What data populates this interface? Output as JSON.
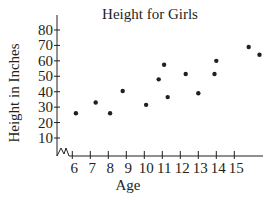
{
  "chart_data": {
    "type": "scatter",
    "title": "Height for Girls",
    "xlabel": "Age",
    "ylabel": "Height in Inches",
    "x_ticks": [
      6,
      7,
      8,
      9,
      10,
      11,
      12,
      13,
      14,
      15
    ],
    "y_ticks": [
      10,
      20,
      30,
      40,
      50,
      60,
      70,
      80
    ],
    "xlim": [
      5,
      16.5
    ],
    "ylim": [
      0,
      85
    ],
    "axis_break": true,
    "grid": false,
    "legend": null,
    "series": [
      {
        "name": "Girls",
        "points": [
          {
            "x": 6.2,
            "y": 26
          },
          {
            "x": 7.3,
            "y": 33
          },
          {
            "x": 8.1,
            "y": 26
          },
          {
            "x": 8.8,
            "y": 40.5
          },
          {
            "x": 10.1,
            "y": 31.5
          },
          {
            "x": 10.8,
            "y": 48
          },
          {
            "x": 11.1,
            "y": 57.5
          },
          {
            "x": 11.3,
            "y": 36.5
          },
          {
            "x": 12.3,
            "y": 51.5
          },
          {
            "x": 13.0,
            "y": 39
          },
          {
            "x": 13.9,
            "y": 51.5
          },
          {
            "x": 14.0,
            "y": 60
          },
          {
            "x": 15.8,
            "y": 69
          },
          {
            "x": 16.4,
            "y": 64
          }
        ]
      }
    ]
  }
}
